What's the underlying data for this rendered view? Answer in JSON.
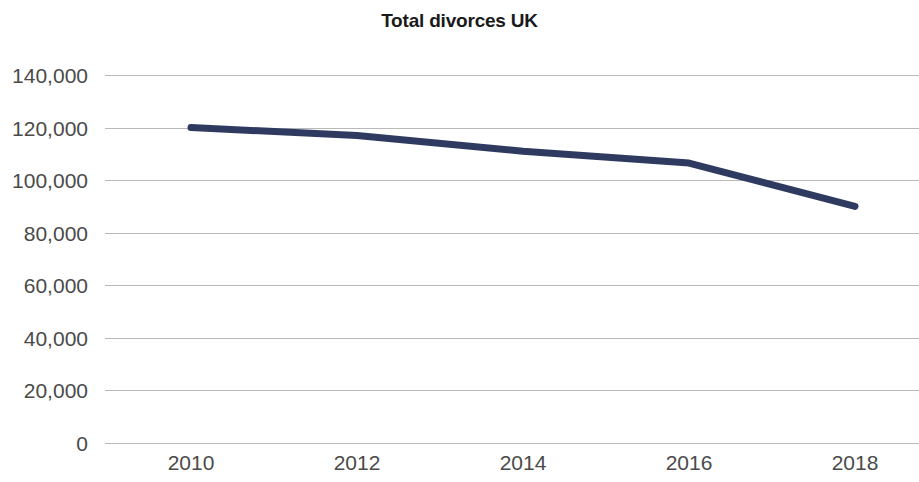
{
  "chart_data": {
    "type": "line",
    "title": "Total divorces UK",
    "xlabel": "",
    "ylabel": "",
    "x": [
      2010,
      2012,
      2014,
      2016,
      2018
    ],
    "series": [
      {
        "name": "Total divorces UK",
        "color": "#2f3a61",
        "values": [
          120000,
          117000,
          111000,
          106500,
          90000
        ]
      }
    ],
    "xlim": [
      2010,
      2018
    ],
    "ylim": [
      0,
      140000
    ],
    "x_tick_labels": [
      "2010",
      "2012",
      "2014",
      "2016",
      "2018"
    ],
    "x_tick_values": [
      2010,
      2012,
      2014,
      2016,
      2018
    ],
    "y_tick_labels": [
      "140,000",
      "120,000",
      "100,000",
      "80,000",
      "60,000",
      "40,000",
      "20,000",
      "0"
    ],
    "y_tick_values": [
      140000,
      120000,
      100000,
      80000,
      60000,
      40000,
      20000,
      0
    ],
    "grid": true,
    "grid_color": "#b9b9b9",
    "legend": false,
    "legend_position": "none",
    "background_color": "#ffffff",
    "tick_label_color": "#4a4a4a",
    "title_color": "#1a1a1a",
    "line_width": 7
  }
}
